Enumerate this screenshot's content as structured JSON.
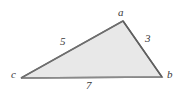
{
  "figure": {
    "type": "triangle-diagram",
    "background_color": "#ffffff",
    "fill_color": "#e8e8e8",
    "stroke_color": "#666666",
    "label_color": "#3a3a3a",
    "vertices": [
      {
        "name": "a",
        "label": "a",
        "x": 123,
        "y": 21
      },
      {
        "name": "b",
        "label": "b",
        "x": 162,
        "y": 77
      },
      {
        "name": "c",
        "label": "c",
        "x": 21,
        "y": 78
      }
    ],
    "sides": [
      {
        "name": "side-ca",
        "from": "c",
        "to": "a",
        "label": "5"
      },
      {
        "name": "side-ab",
        "from": "a",
        "to": "b",
        "label": "3"
      },
      {
        "name": "side-cb",
        "from": "c",
        "to": "b",
        "label": "7"
      }
    ],
    "polygon_points": "123,21 162,77 21,78"
  }
}
